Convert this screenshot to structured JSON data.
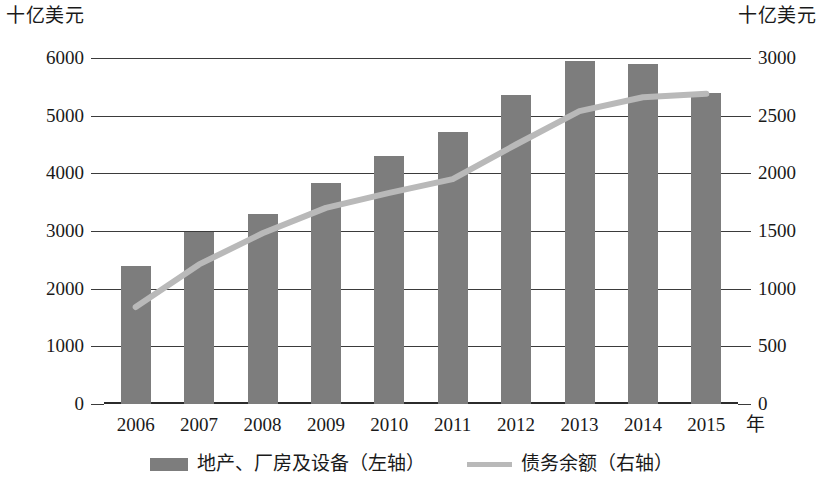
{
  "axis_units": {
    "left": "十亿美元",
    "right": "十亿美元",
    "x": "年"
  },
  "legend": [
    {
      "label": "地产、厂房及设备（左轴）",
      "marker": "bar-swatch",
      "color": "#7d7d7d"
    },
    {
      "label": "债务余额（右轴）",
      "marker": "line-swatch",
      "color": "#b9b9b9"
    }
  ],
  "colors": {
    "bar": "#7d7d7d",
    "line": "#b9b9b9",
    "grid": "#3b3b3b",
    "text": "#1a1a1a",
    "background": "#ffffff"
  },
  "chart_data": {
    "type": "bar",
    "title": "",
    "subtitle": "",
    "xlabel": "年",
    "ylabel": "十亿美元",
    "y2label": "十亿美元",
    "categories": [
      "2006",
      "2007",
      "2008",
      "2009",
      "2010",
      "2011",
      "2012",
      "2013",
      "2014",
      "2015"
    ],
    "yticks": [
      0,
      1000,
      2000,
      3000,
      4000,
      5000,
      6000
    ],
    "y2ticks": [
      0,
      500,
      1000,
      1500,
      2000,
      2500,
      3000
    ],
    "ylim": [
      0,
      6000
    ],
    "y2lim": [
      0,
      3000
    ],
    "grid": true,
    "legend_position": "bottom",
    "series": [
      {
        "name": "地产、厂房及设备（左轴）",
        "type": "bar",
        "axis": "left",
        "color": "#7d7d7d",
        "values": [
          2400,
          2990,
          3300,
          3840,
          4300,
          4720,
          5350,
          5940,
          5890,
          5400
        ]
      },
      {
        "name": "债务余额（右轴）",
        "type": "line",
        "axis": "right",
        "color": "#b9b9b9",
        "values": [
          840,
          1210,
          1480,
          1700,
          1830,
          1950,
          2250,
          2540,
          2660,
          2690
        ]
      }
    ]
  }
}
